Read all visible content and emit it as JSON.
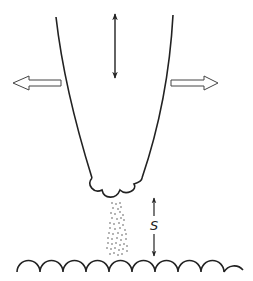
{
  "diagram": {
    "labels": {
      "standoff_distance": "S"
    },
    "elements": [
      "nozzle-body",
      "nozzle-tip-lobes",
      "vertical-motion-arrow",
      "left-expansion-arrow",
      "right-expansion-arrow",
      "particle-spray",
      "standoff-dimension-arrow",
      "scalloped-substrate"
    ],
    "substrate_hump_count": 10,
    "colors": {
      "stroke": "#222222",
      "background": "#ffffff"
    }
  }
}
